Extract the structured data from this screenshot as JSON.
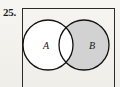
{
  "figure": {
    "problem_number": "25.",
    "type": "venn-diagram",
    "frame": {
      "stroke_color": "#2b2b2b",
      "fill_color": "none",
      "cropped_bottom": true
    },
    "background_color": "#f4f3ef",
    "sets": [
      {
        "id": "set-a",
        "label": "A",
        "shaded": false,
        "fill_color": "#ffffff",
        "stroke_color": "#111111",
        "center_x": 26,
        "center_y": 37,
        "radius": 25
      },
      {
        "id": "set-b",
        "label": "B",
        "shaded": true,
        "fill_color": "#d2d2d2",
        "stroke_color": "#111111",
        "center_x": 62,
        "center_y": 37,
        "radius": 25
      }
    ],
    "intersection": {
      "id": "set-a-intersect-b",
      "label": "",
      "shaded": false,
      "fill_color": "#ffffff"
    },
    "shaded_region_description": "B minus A"
  }
}
